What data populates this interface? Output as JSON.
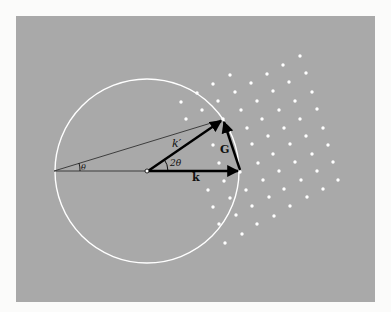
{
  "diagram": {
    "labels": {
      "k_prime": "k′",
      "k": "k",
      "G": "G",
      "two_theta": "2θ",
      "theta": "θ"
    },
    "colors": {
      "background": "#a9a9a9",
      "page": "#fbfbfa",
      "circle": "#ffffff",
      "lattice_points": "#ffffff",
      "vectors": "#000000"
    },
    "geometry": {
      "circle_center": [
        147,
        171
      ],
      "circle_radius": 92,
      "origin": [
        147,
        171
      ],
      "k_tip": [
        240,
        171
      ],
      "k_prime_tip": [
        223,
        119
      ],
      "theta_vertex": [
        54,
        171
      ]
    },
    "lattice_points": [
      [
        300,
        56
      ],
      [
        283,
        65
      ],
      [
        306,
        73
      ],
      [
        230,
        75
      ],
      [
        267,
        74
      ],
      [
        213,
        84
      ],
      [
        251,
        83
      ],
      [
        289,
        82
      ],
      [
        197,
        93
      ],
      [
        235,
        92
      ],
      [
        273,
        91
      ],
      [
        312,
        92
      ],
      [
        181,
        102
      ],
      [
        218,
        101
      ],
      [
        257,
        101
      ],
      [
        295,
        101
      ],
      [
        202,
        110
      ],
      [
        241,
        110
      ],
      [
        279,
        110
      ],
      [
        317,
        109
      ],
      [
        186,
        119
      ],
      [
        223,
        119
      ],
      [
        262,
        119
      ],
      [
        300,
        119
      ],
      [
        247,
        128
      ],
      [
        284,
        128
      ],
      [
        323,
        128
      ],
      [
        268,
        136
      ],
      [
        306,
        136
      ],
      [
        213,
        145
      ],
      [
        252,
        144
      ],
      [
        290,
        144
      ],
      [
        328,
        145
      ],
      [
        273,
        154
      ],
      [
        312,
        154
      ],
      [
        219,
        163
      ],
      [
        258,
        163
      ],
      [
        295,
        162
      ],
      [
        333,
        162
      ],
      [
        240,
        172
      ],
      [
        279,
        171
      ],
      [
        317,
        171
      ],
      [
        224,
        181
      ],
      [
        263,
        180
      ],
      [
        301,
        180
      ],
      [
        338,
        180
      ],
      [
        208,
        190
      ],
      [
        246,
        190
      ],
      [
        284,
        189
      ],
      [
        323,
        189
      ],
      [
        230,
        198
      ],
      [
        269,
        197
      ],
      [
        307,
        197
      ],
      [
        213,
        207
      ],
      [
        252,
        206
      ],
      [
        290,
        206
      ],
      [
        236,
        215
      ],
      [
        274,
        216
      ],
      [
        219,
        224
      ],
      [
        257,
        224
      ],
      [
        242,
        234
      ],
      [
        225,
        243
      ]
    ]
  }
}
